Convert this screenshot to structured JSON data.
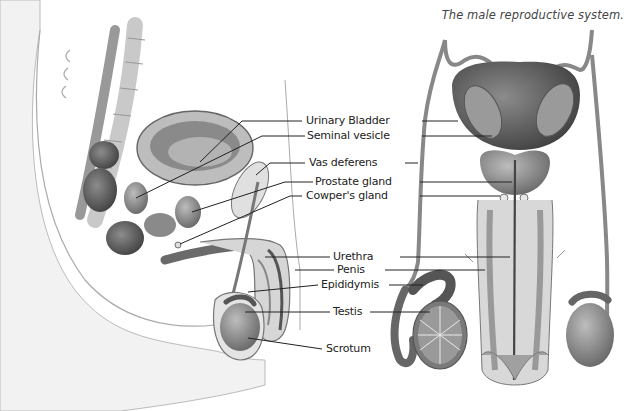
{
  "caption": "The male reproductive system.",
  "labels": [
    {
      "id": "urinary-bladder",
      "text": "Urinary Bladder"
    },
    {
      "id": "seminal-vesicle",
      "text": "Seminal vesicle"
    },
    {
      "id": "vas-deferens",
      "text": "Vas deferens"
    },
    {
      "id": "prostate-gland",
      "text": "Prostate gland"
    },
    {
      "id": "cowpers-gland",
      "text": "Cowper's gland"
    },
    {
      "id": "urethra",
      "text": "Urethra"
    },
    {
      "id": "penis",
      "text": "Penis"
    },
    {
      "id": "epididymis",
      "text": "Epididymis"
    },
    {
      "id": "testis",
      "text": "Testis"
    },
    {
      "id": "scrotum",
      "text": "Scrotum"
    }
  ],
  "views": {
    "left": "sagittal-section",
    "right": "frontal-view"
  },
  "colors": {
    "ink": "#222222",
    "tissue_dark": "#5a5a5a",
    "tissue_mid": "#8a8a8a",
    "tissue_light": "#c8c8c8",
    "skin": "#e6e6e6"
  }
}
